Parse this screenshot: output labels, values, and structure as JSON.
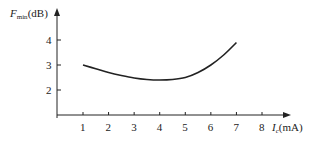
{
  "chart_data": {
    "type": "line",
    "title": "",
    "xlabel": "I_c (mA)",
    "ylabel": "F_min (dB)",
    "xlabel_parts": {
      "symbol": "I",
      "sub": "c",
      "unit": "(mA)"
    },
    "ylabel_parts": {
      "symbol": "F",
      "sub": "min",
      "unit": "(dB)"
    },
    "x_ticks": [
      "1",
      "2",
      "3",
      "4",
      "5",
      "6",
      "7",
      "8"
    ],
    "y_ticks": [
      "2",
      "3",
      "4"
    ],
    "xlim": [
      0,
      9
    ],
    "ylim": [
      1,
      5
    ],
    "grid": false,
    "legend": null,
    "series": [
      {
        "name": "F_min vs I_c",
        "x": [
          1,
          1.5,
          2,
          2.5,
          3,
          3.5,
          4,
          4.5,
          5,
          5.5,
          6,
          6.5,
          7
        ],
        "values": [
          3.0,
          2.85,
          2.7,
          2.58,
          2.48,
          2.42,
          2.4,
          2.42,
          2.5,
          2.7,
          3.0,
          3.4,
          3.9
        ]
      }
    ]
  }
}
